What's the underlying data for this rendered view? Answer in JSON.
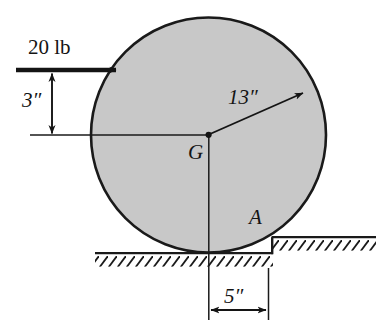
{
  "figure": {
    "type": "engineering-mechanics-free-body-diagram",
    "background_color": "#ffffff",
    "body": {
      "shape": "circle",
      "name": "disk",
      "fill_color": "#c8c8c8",
      "stroke_color": "#1a1a1a",
      "center_label": "G",
      "center_x": 208.5,
      "center_y": 135,
      "radius_px": 118
    },
    "labels": {
      "force": "20 lb",
      "height": "3″",
      "radius": "13″",
      "center": "G",
      "contact_point": "A",
      "offset": "5″"
    },
    "dimensions": [
      {
        "name": "height-above-center",
        "value": "3″",
        "orientation": "vertical"
      },
      {
        "name": "disk-radius",
        "value": "13″",
        "orientation": "radial"
      },
      {
        "name": "step-offset",
        "value": "5″",
        "orientation": "horizontal"
      }
    ],
    "forces": [
      {
        "name": "applied-force",
        "label": "20 lb",
        "direction": "horizontal-right",
        "magnitude": 20,
        "unit": "lb"
      }
    ],
    "ground": {
      "name": "hatched-ground",
      "hatch_color": "#1a1a1a",
      "lower_surface_y": 253,
      "upper_ledge_y": 237,
      "step_x": 272
    }
  }
}
